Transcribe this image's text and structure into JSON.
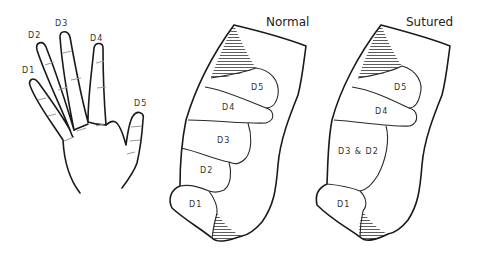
{
  "hand": {
    "labels": {
      "d1": "D1",
      "d2": "D2",
      "d3": "D3",
      "d4": "D4",
      "d5": "D5"
    }
  },
  "normal_map": {
    "title": "Normal",
    "regions": {
      "d1": "D1",
      "d2": "D2",
      "d3": "D3",
      "d4": "D4",
      "d5": "D5"
    }
  },
  "sutured_map": {
    "title": "Sutured",
    "regions": {
      "d1": "D1",
      "d32": "D3 & D2",
      "d4": "D4",
      "d5": "D5"
    }
  },
  "colors": {
    "line": "#1a1a1a",
    "crease": "#9a9a9a",
    "hatch": "#333333",
    "background": "#ffffff"
  }
}
